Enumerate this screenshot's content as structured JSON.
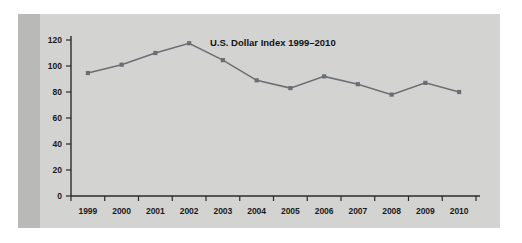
{
  "figure": {
    "panel_background": "#d3d3d2",
    "accent_band_color": "#b9b9b8",
    "page_background": "#ffffff"
  },
  "chart_data": {
    "type": "line",
    "title": "U.S. Dollar Index 1999–2010",
    "xlabel": "",
    "ylabel": "",
    "categories": [
      "1999",
      "2000",
      "2001",
      "2002",
      "2003",
      "2004",
      "2005",
      "2006",
      "2007",
      "2008",
      "2009",
      "2010"
    ],
    "values": [
      94.6,
      101.0,
      110.0,
      117.5,
      104.5,
      89.0,
      83.0,
      92.0,
      86.0,
      78.0,
      87.0,
      80.0
    ],
    "ylim": [
      0,
      120
    ],
    "yticks": [
      0,
      20,
      40,
      60,
      80,
      100,
      120
    ],
    "ytick_labels": [
      "0",
      "20",
      "40",
      "60",
      "80",
      "100",
      "120"
    ],
    "xtick_labels": [
      "1999",
      "2000",
      "2001",
      "2002",
      "2003",
      "2004",
      "2005",
      "2006",
      "2007",
      "2008",
      "2009",
      "2010"
    ],
    "grid": false,
    "legend": null,
    "series_color": "#6b6f74",
    "marker": "square",
    "axis_color": "#2b2b2b",
    "title_position": "inside-top-center-right"
  }
}
